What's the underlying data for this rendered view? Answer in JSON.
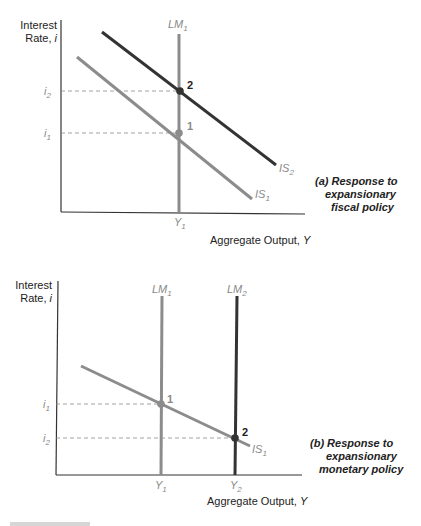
{
  "colors": {
    "axis": "#333333",
    "curve_initial": "#8c8c8c",
    "curve_shifted": "#333333",
    "dashed": "#8c8c8c",
    "label_grey": "#8a8a8a",
    "text": "#222222"
  },
  "panel_a": {
    "y_axis_label_line1": "Interest",
    "y_axis_label_line2": "Rate, ",
    "y_axis_var": "i",
    "x_axis_label": "Aggregate Output, ",
    "x_axis_var": "Y",
    "lm1": {
      "base": "LM",
      "sub": "1"
    },
    "is1": {
      "base": "IS",
      "sub": "1"
    },
    "is2": {
      "base": "IS",
      "sub": "2"
    },
    "i1": {
      "base": "i",
      "sub": "1"
    },
    "i2": {
      "base": "i",
      "sub": "2"
    },
    "y1": {
      "base": "Y",
      "sub": "1"
    },
    "point1": "1",
    "point2": "2",
    "caption_line1": "(a) Response to",
    "caption_line2": "expansionary",
    "caption_line3": "fiscal policy"
  },
  "panel_b": {
    "y_axis_label_line1": "Interest",
    "y_axis_label_line2": "Rate, ",
    "y_axis_var": "i",
    "x_axis_label": "Aggregate Output, ",
    "x_axis_var": "Y",
    "lm1": {
      "base": "LM",
      "sub": "1"
    },
    "lm2": {
      "base": "LM",
      "sub": "2"
    },
    "is1": {
      "base": "IS",
      "sub": "1"
    },
    "i1": {
      "base": "i",
      "sub": "1"
    },
    "i2": {
      "base": "i",
      "sub": "2"
    },
    "y1": {
      "base": "Y",
      "sub": "1"
    },
    "y2": {
      "base": "Y",
      "sub": "2"
    },
    "point1": "1",
    "point2": "2",
    "caption_line1": "(b) Response to",
    "caption_line2": "expansionary",
    "caption_line3": "monetary policy"
  }
}
